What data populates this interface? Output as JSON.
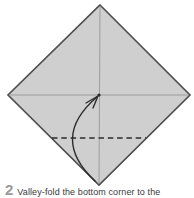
{
  "step": {
    "number": "2",
    "caption": "Valley-fold the bottom corner to the"
  },
  "diagram": {
    "subject": "origami-paper-diamond-valley-fold-step",
    "elements": [
      "paper-square-diamond",
      "vertical-crease",
      "horizontal-crease",
      "valley-fold-dashed-line",
      "curved-fold-arrow",
      "center-target-dot"
    ],
    "colors": {
      "background": "#ffffff",
      "paper_fill": "#cfcfcf",
      "paper_outline": "#4d4d4d",
      "crease": "#909090",
      "fold_line": "#2d2d2d",
      "arrow": "#2d2d2d",
      "step_number": "#9a9a9a",
      "caption_text": "#3a3a3a"
    }
  }
}
